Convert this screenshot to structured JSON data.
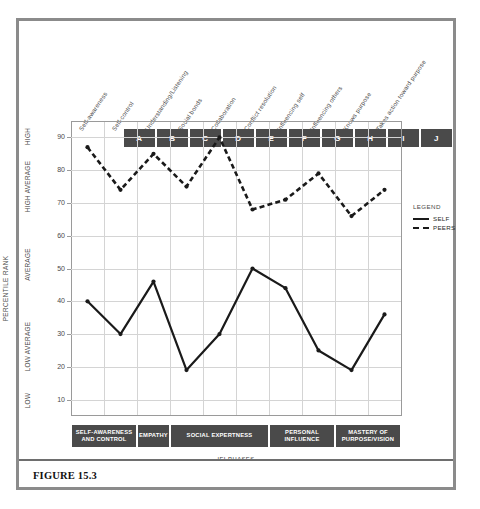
{
  "figure": {
    "caption": "FIGURE 15.3"
  },
  "legend": {
    "title": "LEGEND",
    "entries": [
      {
        "label": "SELF",
        "style": "solid"
      },
      {
        "label": "PEERS",
        "style": "dashed"
      }
    ]
  },
  "axes": {
    "y_title": "PERCENTILE RANK",
    "x_title": "IEI PHASES",
    "y_ticks": [
      90,
      80,
      70,
      60,
      50,
      40,
      30,
      20,
      10
    ],
    "y_bands": [
      {
        "label": "HIGH",
        "from": 85,
        "to": 95
      },
      {
        "label": "HIGH AVERAGE",
        "from": 65,
        "to": 85
      },
      {
        "label": "AVERAGE",
        "from": 40,
        "to": 62
      },
      {
        "label": "LOW AVERAGE",
        "from": 17,
        "to": 35
      },
      {
        "label": "LOW",
        "from": 5,
        "to": 14
      }
    ]
  },
  "columns": [
    {
      "letter": "A",
      "skill": "Self-awareness"
    },
    {
      "letter": "B",
      "skill": "Self-control"
    },
    {
      "letter": "C",
      "skill": "Understanding/Listening"
    },
    {
      "letter": "D",
      "skill": "Social bonds"
    },
    {
      "letter": "E",
      "skill": "Collaboration"
    },
    {
      "letter": "F",
      "skill": "Conflict resolution"
    },
    {
      "letter": "G",
      "skill": "Influencing self"
    },
    {
      "letter": "H",
      "skill": "Influencing others"
    },
    {
      "letter": "I",
      "skill": "Knows purpose"
    },
    {
      "letter": "J",
      "skill": "Takes action toward purpose"
    }
  ],
  "phases": [
    {
      "label": "SELF-AWARENESS AND CONTROL",
      "span": 2
    },
    {
      "label": "EMPATHY",
      "span": 1
    },
    {
      "label": "SOCIAL EXPERTNESS",
      "span": 3
    },
    {
      "label": "PERSONAL INFLUENCE",
      "span": 2
    },
    {
      "label": "MASTERY OF PURPOSE/VISION",
      "span": 2
    }
  ],
  "colors": {
    "series": "#1a1a1a",
    "box_fill": "#4a4a4a",
    "grid": "#d4d4d4",
    "frame": "#8b8b8b"
  },
  "chart_data": {
    "type": "line",
    "title": "FIGURE 15.3",
    "xlabel": "IEI PHASES",
    "ylabel": "PERCENTILE RANK",
    "ylim": [
      5,
      95
    ],
    "grid": true,
    "legend_position": "right",
    "categories": [
      "A",
      "B",
      "C",
      "D",
      "E",
      "F",
      "G",
      "H",
      "I",
      "J"
    ],
    "category_labels": [
      "Self-awareness",
      "Self-control",
      "Understanding/Listening",
      "Social bonds",
      "Collaboration",
      "Conflict resolution",
      "Influencing self",
      "Influencing others",
      "Knows purpose",
      "Takes action toward purpose"
    ],
    "series": [
      {
        "name": "SELF",
        "style": "solid",
        "values": [
          40,
          30,
          46,
          19,
          30,
          50,
          44,
          25,
          19,
          36
        ]
      },
      {
        "name": "PEERS",
        "style": "dashed",
        "values": [
          87,
          74,
          85,
          75,
          90,
          68,
          71,
          79,
          66,
          74
        ]
      }
    ],
    "y_tick_labels": [
      90,
      80,
      70,
      60,
      50,
      40,
      30,
      20,
      10
    ],
    "y_band_labels": [
      "HIGH",
      "HIGH AVERAGE",
      "AVERAGE",
      "LOW AVERAGE",
      "LOW"
    ],
    "annotations": [
      "IEI PHASES",
      "PERCENTILE RANK",
      "LEGEND"
    ]
  }
}
